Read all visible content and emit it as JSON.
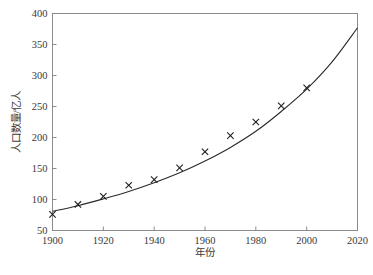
{
  "chart_data": {
    "type": "scatter",
    "title": "",
    "subtitle": "",
    "xlabel": "年份",
    "ylabel": "人口数量/亿人",
    "xlim": [
      1900,
      2020
    ],
    "ylim": [
      50,
      400
    ],
    "grid": false,
    "legend": null,
    "x_ticks": [
      1900,
      1920,
      1940,
      1960,
      1980,
      2000,
      2020
    ],
    "x_tick_labels": [
      "1900",
      "1920",
      "1940",
      "1960",
      "1980",
      "2000",
      "2020"
    ],
    "x_minor_ticks": [
      1910,
      1930,
      1950,
      1970,
      1990,
      2010
    ],
    "y_ticks": [
      50,
      100,
      150,
      200,
      250,
      300,
      350,
      400
    ],
    "y_tick_labels": [
      "50",
      "100",
      "150",
      "200",
      "250",
      "300",
      "350",
      "400"
    ],
    "marker": "x",
    "marker_color": "#1f1f1f",
    "line_color": "#2a2a2a",
    "series": [
      {
        "name": "观测数据",
        "type": "scatter",
        "marker": "x",
        "x": [
          1900,
          1910,
          1920,
          1930,
          1940,
          1950,
          1960,
          1970,
          1980,
          1990,
          2000
        ],
        "values": [
          76,
          92,
          105,
          123,
          132,
          151,
          177,
          203,
          225,
          251,
          280
        ]
      },
      {
        "name": "拟合曲线",
        "type": "line",
        "x": [
          1900,
          1910,
          1920,
          1930,
          1940,
          1950,
          1960,
          1970,
          1980,
          1990,
          2000,
          2010,
          2020
        ],
        "values": [
          81,
          90,
          101,
          113,
          127,
          143,
          162,
          184,
          210,
          242,
          278,
          322,
          377
        ]
      }
    ]
  },
  "axes": {
    "x_axis_title": "年份",
    "y_axis_title": "人口数量/亿人"
  },
  "colors": {
    "frame": "#8c8c8c",
    "text": "#3a3a3a",
    "curve": "#2a2a2a",
    "marker": "#1f1f1f",
    "background": "#ffffff"
  }
}
